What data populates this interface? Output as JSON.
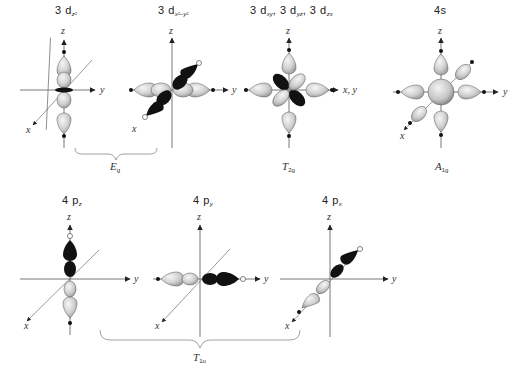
{
  "orbitals": [
    {
      "id": "3dz2",
      "main": "3 d",
      "sub": "z²",
      "symmetry_group": "Eg"
    },
    {
      "id": "3dx2-y2",
      "main": "3 d",
      "sub": "x²−y²",
      "symmetry_group": "Eg"
    },
    {
      "id": "3dxy_yz_zx",
      "parts": [
        {
          "main": "3 d",
          "sub": "xy"
        },
        {
          "main": "3 d",
          "sub": "yz"
        },
        {
          "main": "3 d",
          "sub": "zx"
        }
      ],
      "symmetry_group": "T2g"
    },
    {
      "id": "4s",
      "main": "4s",
      "symmetry_group": "A1g"
    },
    {
      "id": "4pz",
      "main": "4 p",
      "sub": "z",
      "symmetry_group": "T1u"
    },
    {
      "id": "4py",
      "main": "4 p",
      "sub": "y",
      "symmetry_group": "T1u"
    },
    {
      "id": "4px",
      "main": "4 p",
      "sub": "x",
      "symmetry_group": "T1u"
    }
  ],
  "labels": {
    "o1_main": "3 d",
    "o1_sub": "z²",
    "o2_main": "3 d",
    "o2_sub": "x²−y²",
    "o3_a": "3 d",
    "o3_a_sub": "xy",
    "o3_sep1": ",",
    "o3_b": " 3 d",
    "o3_b_sub": "yz",
    "o3_sep2": ",",
    "o3_c": " 3 d",
    "o3_c_sub": "zx",
    "o4_main": "4s",
    "o5_main": "4 p",
    "o5_sub": "z",
    "o6_main": "4 p",
    "o6_sub": "y",
    "o7_main": "4 p",
    "o7_sub": "x"
  },
  "symmetry": {
    "eg": {
      "main": "E",
      "sub": "g"
    },
    "t2g": {
      "main": "T",
      "sub": "2g"
    },
    "a1g": {
      "main": "A",
      "sub": "1g"
    },
    "t1u": {
      "main": "T",
      "sub": "1u"
    }
  },
  "axes": {
    "x": "x",
    "y": "y",
    "z": "z",
    "xy": "x, y"
  },
  "colors": {
    "positive_lobe": "#000000",
    "negative_lobe": "#d8d8d8",
    "axis": "#333333",
    "brace": "#888888"
  }
}
